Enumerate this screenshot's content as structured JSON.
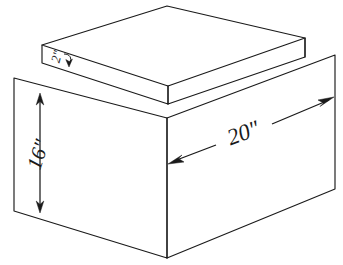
{
  "figure": {
    "kind": "technical-line-drawing",
    "background_color": "#ffffff",
    "line_color": "#1a1a1a"
  },
  "dimensions": {
    "height": {
      "label": "16\"",
      "value": 16,
      "unit": "inch",
      "describes": "box-height",
      "arrow_style": "double-headed-vertical"
    },
    "depth": {
      "label": "20\"",
      "value": 20,
      "unit": "inch",
      "describes": "box-depth-right-face",
      "arrow_style": "double-headed-diagonal"
    },
    "slab_thickness": {
      "label": "2\"",
      "value": 2,
      "unit": "inch",
      "describes": "top-slab-thickness",
      "arrow_style": "short-curved-leader"
    }
  },
  "geometry": {
    "slab": {
      "top_face": "42,45 167,6 305,38 168,86",
      "front_left_face": "42,45 168,86 168,104 42,63",
      "front_right_face": "168,86 305,38 305,57 168,104"
    },
    "box": {
      "left_face": "14,78 167,118 167,258 14,211",
      "right_face": "167,118 335,55 335,189 167,258",
      "top_edge_left": "14,78 167,118",
      "top_edge_right": "167,118 335,55"
    }
  }
}
